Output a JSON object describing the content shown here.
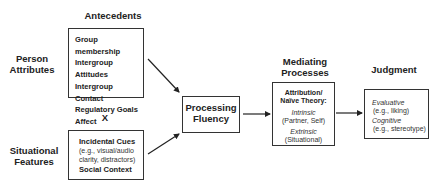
{
  "antecedents": {
    "header": "Antecedents",
    "person_label_1": "Person",
    "person_label_2": "Attributes",
    "person_items": [
      "Group membership",
      "Intergroup Attitudes",
      "Intergroup Contact",
      "Regulatory Goals",
      "Affect"
    ],
    "times": "X",
    "situational_label_1": "Situational",
    "situational_label_2": "Features",
    "situational_items": {
      "cues": "Incidental Cues",
      "cues_eg_1": "(e.g., visual/audio",
      "cues_eg_2": "clarity, distractors)",
      "social": "Social Context"
    }
  },
  "fluency": {
    "line1": "Processing",
    "line2": "Fluency"
  },
  "mediating": {
    "header_1": "Mediating",
    "header_2": "Processes",
    "title_1": "Attribution/",
    "title_2": "Naïve Theory:",
    "intrinsic": "Intrinsic",
    "intrinsic_eg": "(Partner, Self)",
    "extrinsic": "Extrinsic",
    "extrinsic_eg": "(Situational)"
  },
  "judgment": {
    "header": "Judgment",
    "evaluative": "Evaluative",
    "evaluative_eg": "(e.g., liking)",
    "cognitive": "Cognitive",
    "cognitive_eg": "(e.g., stereotype)"
  }
}
